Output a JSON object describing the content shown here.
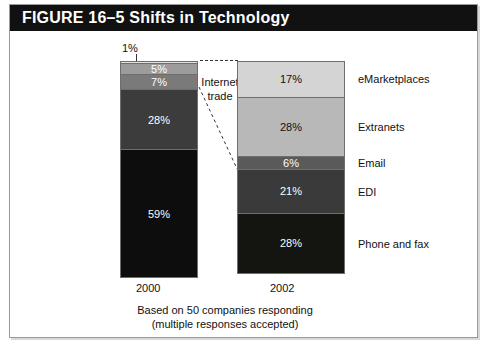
{
  "figure": {
    "header_title": "FIGURE 16–5 Shifts in Technology",
    "annotation": {
      "line1": "Internet",
      "line2": "trade"
    },
    "caption": {
      "line1": "Based on 50 companies responding",
      "line2": "(multiple responses accepted)"
    },
    "colors": {
      "header_background": "#111111",
      "frame_border": "#9a9a9a",
      "page_background": "#ffffff",
      "segment_outline": "#6e6e6e"
    }
  },
  "chart_data": {
    "type": "bar",
    "subtype": "stacked-100-percent",
    "title": "FIGURE 16–5 Shifts in Technology",
    "xlabel": "",
    "ylabel": "",
    "ylim": [
      0,
      100
    ],
    "grid": false,
    "legend": "right-of-bars (category names beside 2002 bar)",
    "categories": [
      "2000",
      "2002"
    ],
    "annotations": [
      "Internet trade",
      "Based on 50 companies responding",
      "(multiple responses accepted)"
    ],
    "series": [
      {
        "name": "eMarketplaces",
        "values": [
          1,
          17
        ],
        "color_2000": "#e2e2e2",
        "color_2002": "#d4d4d4",
        "label_color_2000": "#111111",
        "label_color_2002": "#111111"
      },
      {
        "name": "Extranets",
        "values": [
          5,
          28
        ],
        "color_2000": "#9c9c9c",
        "color_2002": "#b8b8b8",
        "label_color_2000": "#ffffff",
        "label_color_2002": "#111111"
      },
      {
        "name": "Email",
        "values": [
          7,
          6
        ],
        "color_2000": "#7a7a7a",
        "color_2002": "#5a5a5a",
        "label_color_2000": "#ffffff",
        "label_color_2002": "#ffffff"
      },
      {
        "name": "EDI",
        "values": [
          28,
          21
        ],
        "color_2000": "#3c3c3c",
        "color_2002": "#3a3a3a",
        "label_color_2000": "#ffffff",
        "label_color_2002": "#ffffff"
      },
      {
        "name": "Phone and fax",
        "values": [
          59,
          28
        ],
        "color_2000": "#0d0d0d",
        "color_2002": "#141410",
        "label_color_2000": "#ffffff",
        "label_color_2002": "#ffffff"
      }
    ]
  },
  "bar_2000": {
    "year": "2000",
    "callout_value": "1%",
    "segments": [
      {
        "value": "1%",
        "pct": 1,
        "color": "#e2e2e2",
        "text_color": "#111111",
        "show_label": false
      },
      {
        "value": "5%",
        "pct": 5,
        "color": "#9c9c9c",
        "text_color": "#ffffff",
        "show_label": true
      },
      {
        "value": "7%",
        "pct": 7,
        "color": "#7a7a7a",
        "text_color": "#ffffff",
        "show_label": true
      },
      {
        "value": "28%",
        "pct": 28,
        "color": "#3c3c3c",
        "text_color": "#ffffff",
        "show_label": true
      },
      {
        "value": "59%",
        "pct": 59,
        "color": "#0d0d0d",
        "text_color": "#ffffff",
        "show_label": true
      }
    ]
  },
  "bar_2002": {
    "year": "2002",
    "segments": [
      {
        "value": "17%",
        "pct": 17,
        "label": "eMarketplaces",
        "color": "#d4d4d4",
        "text_color": "#111111"
      },
      {
        "value": "28%",
        "pct": 28,
        "label": "Extranets",
        "color": "#b8b8b8",
        "text_color": "#111111"
      },
      {
        "value": "6%",
        "pct": 6,
        "label": "Email",
        "color": "#5a5a5a",
        "text_color": "#ffffff"
      },
      {
        "value": "21%",
        "pct": 21,
        "label": "EDI",
        "color": "#3a3a3a",
        "text_color": "#ffffff"
      },
      {
        "value": "28%",
        "pct": 28,
        "label": "Phone and fax",
        "color": "#141410",
        "text_color": "#ffffff"
      }
    ]
  }
}
